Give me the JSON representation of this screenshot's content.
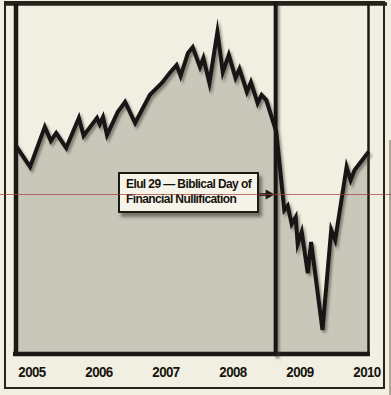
{
  "figure": {
    "background_color": "#f1eee2",
    "frame_color": "#26231d",
    "ink_color": "#181612"
  },
  "annotation": {
    "line1": "Elul 29 — Biblical Day of",
    "line2": "Financial Nullification"
  },
  "chart_data": {
    "type": "area",
    "title": "",
    "xlabel": "",
    "ylabel": "",
    "grid": false,
    "legend": "none",
    "x_ticks": [
      "2005",
      "2006",
      "2007",
      "2008",
      "2009",
      "2010"
    ],
    "xlim": [
      2004.73,
      2010.05
    ],
    "ylim": [
      5900,
      14900
    ],
    "area_fill_color": "#c9c6ba",
    "line_color": "#181612",
    "series": [
      {
        "name": "stock-index",
        "x": [
          2004.73,
          2004.85,
          2004.97,
          2005.19,
          2005.28,
          2005.36,
          2005.51,
          2005.7,
          2005.77,
          2005.97,
          2006.01,
          2006.06,
          2006.12,
          2006.28,
          2006.39,
          2006.54,
          2006.76,
          2006.94,
          2007.06,
          2007.16,
          2007.22,
          2007.33,
          2007.4,
          2007.51,
          2007.56,
          2007.65,
          2007.77,
          2007.85,
          2007.94,
          2008.04,
          2008.1,
          2008.21,
          2008.27,
          2008.37,
          2008.43,
          2008.5,
          2008.65,
          2008.77,
          2008.82,
          2008.88,
          2008.94,
          2008.97,
          2009.03,
          2009.12,
          2009.17,
          2009.34,
          2009.47,
          2009.53,
          2009.7,
          2009.76,
          2009.82,
          2010.03
        ],
        "values": [
          11330,
          11020,
          10710,
          11740,
          11380,
          11580,
          11200,
          11970,
          11510,
          11970,
          11810,
          11990,
          11530,
          12120,
          12380,
          11840,
          12560,
          12870,
          13130,
          13330,
          13050,
          13640,
          13790,
          13280,
          13510,
          12870,
          14180,
          13150,
          13590,
          13000,
          13230,
          12640,
          12890,
          12350,
          12560,
          12430,
          11610,
          9600,
          9710,
          9240,
          9420,
          8730,
          9040,
          7980,
          8780,
          6520,
          9090,
          8830,
          10710,
          10370,
          10630,
          11100
        ]
      }
    ],
    "event_line": {
      "x": 2008.64,
      "annotation_ref": "annotation",
      "color": "#181612"
    },
    "reference_line": {
      "value": 10000,
      "color": "#a8423a",
      "full_width": true
    }
  }
}
